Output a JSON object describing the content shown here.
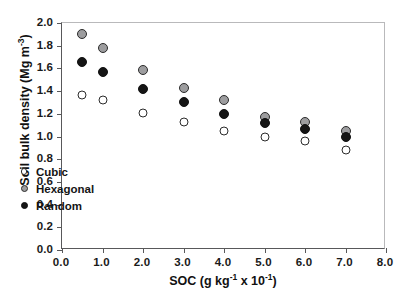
{
  "chart_data": {
    "type": "scatter",
    "title": "",
    "xlabel": "SOC (g kg-1 x 10-1)",
    "ylabel": "Soil bulk density (Mg m-3)",
    "xlabel_parts": {
      "base1": "SOC (g kg",
      "sup1": "-1",
      "mid": " x 10",
      "sup2": "-1",
      "base2": ")"
    },
    "ylabel_parts": {
      "base1": "Soil bulk density (Mg m",
      "sup1": "-3",
      "base2": ")"
    },
    "xlim": [
      0.0,
      8.0
    ],
    "ylim": [
      0.0,
      2.0
    ],
    "xticks": [
      "0.0",
      "1.0",
      "2.0",
      "3.0",
      "4.0",
      "5.0",
      "6.0",
      "7.0",
      "8.0"
    ],
    "xtick_values": [
      0.0,
      1.0,
      2.0,
      3.0,
      4.0,
      5.0,
      6.0,
      7.0,
      8.0
    ],
    "yticks": [
      "0.0",
      "0.2",
      "0.4",
      "0.6",
      "0.8",
      "1.0",
      "1.2",
      "1.4",
      "1.6",
      "1.8",
      "2.0"
    ],
    "ytick_values": [
      0.0,
      0.2,
      0.4,
      0.6,
      0.8,
      1.0,
      1.2,
      1.4,
      1.6,
      1.8,
      2.0
    ],
    "grid": false,
    "legend_position": "lower-left-inside",
    "x": [
      0.5,
      1.0,
      2.0,
      3.0,
      4.0,
      5.0,
      6.0,
      7.0
    ],
    "series": [
      {
        "name": "Cubic",
        "marker": "open-circle",
        "color": "#ffffff",
        "edge_color": "#2b2b2b",
        "values": [
          1.37,
          1.32,
          1.21,
          1.13,
          1.05,
          1.0,
          0.96,
          0.88
        ]
      },
      {
        "name": "Hexagonal",
        "marker": "gray-circle",
        "color": "#9d9d9f",
        "edge_color": "#2b2b2b",
        "values": [
          1.9,
          1.78,
          1.59,
          1.43,
          1.32,
          1.17,
          1.13,
          1.05
        ]
      },
      {
        "name": "Random",
        "marker": "filled-circle",
        "color": "#151515",
        "edge_color": "#111111",
        "values": [
          1.66,
          1.57,
          1.42,
          1.3,
          1.2,
          1.12,
          1.07,
          1.0
        ]
      }
    ]
  }
}
